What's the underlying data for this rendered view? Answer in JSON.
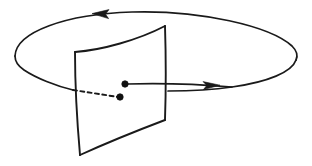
{
  "figure": {
    "background_color": "#ffffff",
    "ink_color": "#1a1a1a",
    "width": 312,
    "height": 166,
    "caption": "",
    "labels": []
  },
  "elements": {
    "orbit": {
      "name": "closed periodic orbit",
      "shape": "ellipse",
      "center_x": 155,
      "center_y": 53,
      "radius_x": 141,
      "radius_y": 39,
      "direction": "clockwise-viewed-from-above",
      "stroke_color": "#1a1a1a",
      "stroke_width": 1.7
    },
    "section_surface": {
      "name": "transversal Poincare section",
      "shape": "curved quadrilateral",
      "corner_top_left": [
        75,
        52
      ],
      "corner_top_right": [
        165,
        26
      ],
      "corner_bottom_right": [
        165,
        120
      ],
      "corner_bottom_left": [
        80,
        155
      ],
      "stroke_color": "#1a1a1a",
      "stroke_width": 1.9
    },
    "return_point": {
      "name": "returned intersection point",
      "x": 125,
      "y": 84,
      "radius": 3.2,
      "fill": "#111111"
    },
    "start_point": {
      "name": "initial intersection point",
      "x": 120,
      "y": 97,
      "radius": 3.2,
      "fill": "#111111"
    },
    "trajectory_visible": {
      "name": "orbit segment leaving section",
      "from": [
        125,
        84
      ],
      "to": [
        232,
        84
      ],
      "style": "solid"
    },
    "trajectory_hidden": {
      "name": "orbit segment behind section",
      "from": [
        73,
        90
      ],
      "to": [
        120,
        97
      ],
      "style": "dashed",
      "dash_pattern": "4 3.4"
    },
    "arrow_top": {
      "name": "flow direction arrow on far side",
      "x": 101,
      "y": 14,
      "direction": "left"
    },
    "arrow_right": {
      "name": "flow direction arrow on near side",
      "x": 212,
      "y": 88,
      "direction": "right"
    }
  }
}
